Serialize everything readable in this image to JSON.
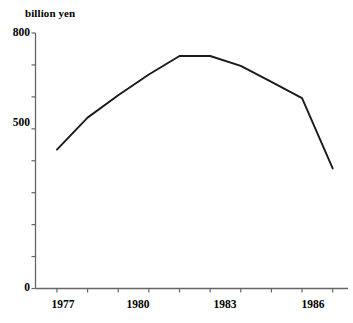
{
  "chart_data": {
    "type": "line",
    "title": "",
    "subtitle": "",
    "xlabel": "",
    "ylabel": "billion yen",
    "unit_label": "billion yen",
    "x": [
      1977,
      1978,
      1979,
      1980,
      1981,
      1982,
      1983,
      1984,
      1985,
      1986
    ],
    "values": [
      435,
      535,
      605,
      670,
      728,
      728,
      697,
      647,
      596,
      376
    ],
    "series": [
      {
        "name": "",
        "values": [
          435,
          535,
          605,
          670,
          728,
          728,
          697,
          647,
          596,
          376
        ]
      }
    ],
    "xlim": [
      1976.3,
      1986.5
    ],
    "ylim": [
      0,
      800
    ],
    "x_tick_labels": [
      "1977",
      "1980",
      "1983",
      "1986"
    ],
    "x_tick_values": [
      1977,
      1980,
      1983,
      1986
    ],
    "x_minor_ticks": [
      1977,
      1978,
      1979,
      1980,
      1981,
      1982,
      1983,
      1984,
      1985,
      1986
    ],
    "y_tick_labels": [
      "0",
      "500",
      "800"
    ],
    "y_tick_values": [
      0,
      500,
      800
    ],
    "y_minor_tick_values": [
      0,
      100,
      200,
      300,
      400,
      500,
      600,
      700,
      800
    ],
    "grid": false,
    "legend": false,
    "legend_position": "none",
    "line_color": "#1a1a1a",
    "axis_color": "#555555",
    "background_color": "#ffffff",
    "annotations": []
  },
  "axes": {
    "y_unit_caption": "billion yen",
    "y_labels": [
      {
        "text": "800",
        "value": 800
      },
      {
        "text": "500",
        "value": 500
      },
      {
        "text": "0",
        "value": 0
      }
    ],
    "x_labels": [
      {
        "text": "1977",
        "value": 1977
      },
      {
        "text": "1980",
        "value": 1980
      },
      {
        "text": "1983",
        "value": 1983
      },
      {
        "text": "1986",
        "value": 1986
      }
    ]
  }
}
